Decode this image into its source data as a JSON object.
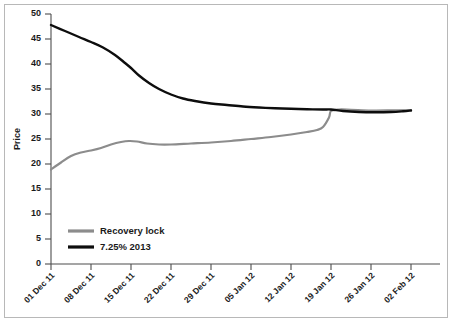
{
  "chart_data": {
    "type": "line",
    "title": "",
    "xlabel": "",
    "ylabel": "Price",
    "ylim": [
      0,
      50
    ],
    "ytick_values": [
      0,
      5,
      10,
      15,
      20,
      25,
      30,
      35,
      40,
      45,
      50
    ],
    "ytick_labels": [
      "0",
      "5",
      "10",
      "15",
      "20",
      "25",
      "30",
      "35",
      "40",
      "45",
      "50"
    ],
    "grid": false,
    "legend_position": "lower-left",
    "categories": [
      "01 Dec 11",
      "08 Dec 11",
      "15 Dec 11",
      "22 Dec 11",
      "29 Dec 11",
      "05 Jan 12",
      "12 Jan 12",
      "19 Jan 12",
      "26 Jan 12",
      "02 Feb 12"
    ],
    "x": [
      0,
      1,
      2,
      3,
      4,
      5,
      6,
      7,
      8,
      9
    ],
    "series": [
      {
        "name": "Recovery lock",
        "color": "#8c8c8c",
        "values": [
          18.9,
          22.6,
          24.5,
          23.9,
          24.6,
          25.4,
          26.3,
          30.9,
          30.7,
          30.8
        ],
        "dense_x": [
          0.0,
          0.25,
          0.5,
          0.75,
          1.0,
          1.25,
          1.5,
          1.75,
          1.95,
          2.15,
          2.4,
          2.7,
          3.0,
          3.5,
          4.0,
          4.5,
          5.0,
          5.5,
          6.0,
          6.4,
          6.65,
          6.8,
          6.95,
          7.0,
          7.2,
          7.5,
          8.0,
          8.5,
          9.0
        ],
        "dense_y": [
          18.9,
          20.3,
          21.6,
          22.3,
          22.7,
          23.2,
          23.9,
          24.4,
          24.6,
          24.5,
          24.1,
          23.9,
          23.9,
          24.1,
          24.3,
          24.6,
          25.0,
          25.4,
          25.9,
          26.4,
          26.8,
          27.4,
          29.3,
          30.6,
          30.9,
          30.85,
          30.7,
          30.72,
          30.8
        ]
      },
      {
        "name": "7.25% 2013",
        "color": "#0d0d0d",
        "values": [
          47.8,
          44.9,
          41.9,
          35.1,
          32.6,
          31.6,
          31.1,
          30.9,
          30.4,
          30.7
        ],
        "dense_x": [
          0.0,
          0.35,
          0.7,
          1.0,
          1.3,
          1.6,
          1.85,
          2.0,
          2.2,
          2.45,
          2.7,
          3.0,
          3.3,
          3.6,
          4.0,
          4.4,
          4.8,
          5.2,
          5.6,
          6.0,
          6.4,
          6.8,
          7.0,
          7.3,
          7.7,
          8.1,
          8.5,
          8.8,
          9.0
        ],
        "dense_y": [
          47.8,
          46.6,
          45.4,
          44.4,
          43.3,
          41.8,
          40.2,
          39.2,
          37.7,
          36.2,
          35.0,
          33.9,
          33.1,
          32.6,
          32.1,
          31.8,
          31.5,
          31.3,
          31.15,
          31.05,
          30.95,
          30.9,
          30.9,
          30.6,
          30.4,
          30.35,
          30.4,
          30.55,
          30.7
        ]
      }
    ],
    "legend": [
      {
        "label": "Recovery lock",
        "color": "#8c8c8c"
      },
      {
        "label": "7.25% 2013",
        "color": "#0d0d0d"
      }
    ]
  }
}
